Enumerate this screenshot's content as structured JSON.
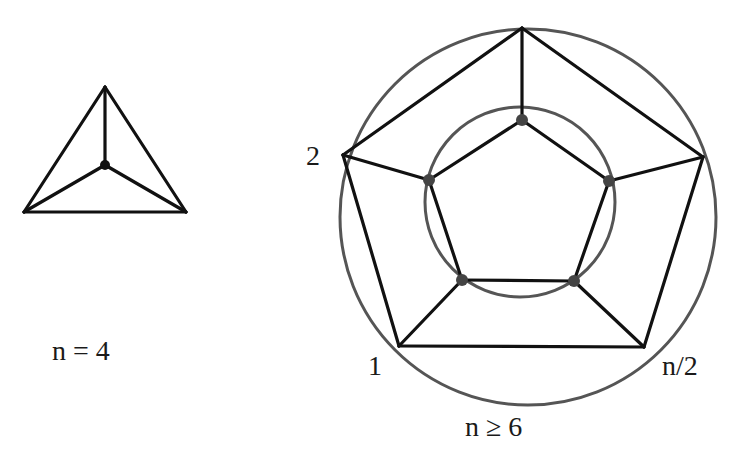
{
  "figure": {
    "colors": {
      "edge": "#111111",
      "circle": "#555555",
      "vertex": "#444444",
      "background": "#ffffff"
    },
    "left_graph": {
      "caption": "n = 4",
      "description": "K4 drawn as triangle with central vertex",
      "vertices": [
        [
          105,
          87
        ],
        [
          24,
          212
        ],
        [
          186,
          212
        ],
        [
          105,
          165
        ]
      ],
      "edges": [
        [
          0,
          1
        ],
        [
          1,
          2
        ],
        [
          2,
          0
        ],
        [
          0,
          3
        ],
        [
          1,
          3
        ],
        [
          2,
          3
        ]
      ]
    },
    "right_graph": {
      "caption": "n ≥ 6",
      "description": "Prism graph: outer pentagon and inner pentagon connected by spokes, each on a circle",
      "outer_circle": {
        "cx": 528,
        "cy": 217,
        "r": 188
      },
      "inner_circle": {
        "cx": 520,
        "cy": 202,
        "r": 95
      },
      "outer_vertices": [
        [
          522,
          28
        ],
        [
          703,
          157
        ],
        [
          644,
          347
        ],
        [
          399,
          346
        ],
        [
          343,
          155
        ]
      ],
      "inner_vertices": [
        [
          522,
          120
        ],
        [
          609,
          181
        ],
        [
          574,
          281
        ],
        [
          462,
          280
        ],
        [
          429,
          180
        ]
      ],
      "vertex_labels": [
        {
          "text": "2",
          "x": 306,
          "y": 165
        },
        {
          "text": "1",
          "x": 368,
          "y": 375
        },
        {
          "text": "n/2",
          "x": 662,
          "y": 375
        }
      ]
    }
  }
}
